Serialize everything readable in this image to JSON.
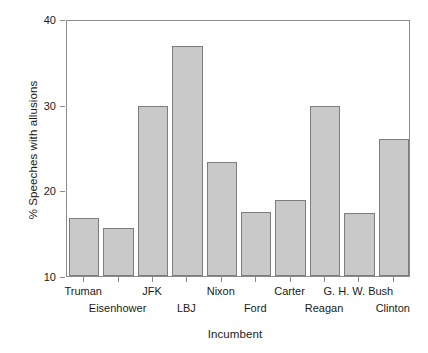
{
  "chart_data": {
    "type": "bar",
    "title": "",
    "xlabel": "Incumbent",
    "ylabel": "% Speeches with allusions",
    "ylim": [
      10,
      40
    ],
    "yticks": [
      10,
      20,
      30,
      40
    ],
    "ytick_labels": [
      "10",
      "20",
      "30",
      "40"
    ],
    "grid": false,
    "legend": "none",
    "categories": [
      "Truman",
      "Eisenhower",
      "JFK",
      "LBJ",
      "Nixon",
      "Ford",
      "Carter",
      "Reagan",
      "G. H. W. Bush",
      "Clinton"
    ],
    "label_rows": [
      "upper",
      "lower",
      "upper",
      "lower",
      "upper",
      "lower",
      "upper",
      "lower",
      "upper",
      "lower"
    ],
    "values": [
      16.8,
      15.6,
      29.8,
      36.9,
      23.3,
      17.5,
      18.9,
      29.8,
      17.4,
      26.0
    ],
    "bar_color": "#c9c9c9",
    "bar_edge_color": "#7d7d7d",
    "axis_color": "#8a8a8a",
    "text_color": "#1a1a1a"
  }
}
